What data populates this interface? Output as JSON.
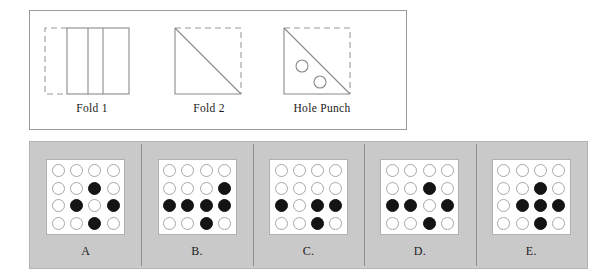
{
  "puzzle": {
    "type": "paper-folding-hole-punch",
    "steps": [
      {
        "id": "fold-1",
        "caption": "Fold 1",
        "description": "Square sheet folded left edge over; dashed outline on left shows folded-away half, two vertical crease lines visible"
      },
      {
        "id": "fold-2",
        "caption": "Fold 2",
        "description": "Folded diagonally from top-left corner to bottom-right corner; dashed outline on top and right shows folded-away triangle"
      },
      {
        "id": "hole-punch",
        "caption": "Hole Punch",
        "description": "Two holes punched in the lower-left triangle below the diagonal"
      }
    ],
    "holes": [
      {
        "cx": 34,
        "cy": 44,
        "r": 6
      },
      {
        "cx": 52,
        "cy": 60,
        "r": 6
      }
    ]
  },
  "options": [
    {
      "label": "A",
      "grid": [
        [
          0,
          0,
          0,
          0
        ],
        [
          0,
          0,
          1,
          0
        ],
        [
          0,
          1,
          0,
          1
        ],
        [
          0,
          0,
          1,
          0
        ]
      ]
    },
    {
      "label": "B.",
      "grid": [
        [
          0,
          0,
          0,
          0
        ],
        [
          0,
          0,
          0,
          1
        ],
        [
          1,
          1,
          1,
          1
        ],
        [
          0,
          0,
          1,
          0
        ]
      ]
    },
    {
      "label": "C.",
      "grid": [
        [
          0,
          0,
          0,
          0
        ],
        [
          0,
          0,
          0,
          0
        ],
        [
          1,
          0,
          1,
          1
        ],
        [
          0,
          0,
          1,
          0
        ]
      ]
    },
    {
      "label": "D.",
      "grid": [
        [
          0,
          0,
          0,
          0
        ],
        [
          0,
          0,
          1,
          0
        ],
        [
          1,
          1,
          0,
          1
        ],
        [
          0,
          0,
          1,
          0
        ]
      ]
    },
    {
      "label": "E.",
      "grid": [
        [
          0,
          0,
          0,
          0
        ],
        [
          0,
          0,
          1,
          0
        ],
        [
          0,
          1,
          1,
          1
        ],
        [
          0,
          0,
          1,
          0
        ]
      ]
    }
  ],
  "colors": {
    "panel_background": "#c9c9c9",
    "card_background": "#ffffff",
    "dot_filled": "#141414",
    "dot_empty_border": "#a8a8a8",
    "line": "#8f8f8f",
    "border": "#9a9a9a"
  }
}
